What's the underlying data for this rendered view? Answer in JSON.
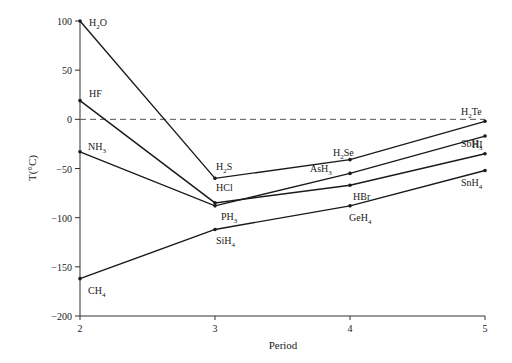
{
  "chart_data": {
    "type": "line",
    "title": "",
    "xlabel": "Period",
    "ylabel": "T(°C)",
    "x": [
      2,
      3,
      4,
      5
    ],
    "xlim": [
      2,
      5
    ],
    "ylim": [
      -200,
      100
    ],
    "xticks": [
      "2",
      "3",
      "4",
      "5"
    ],
    "yticks": [
      "100",
      "50",
      "0",
      "−50",
      "−100",
      "−150",
      "−200"
    ],
    "ytick_values": [
      100,
      50,
      0,
      -50,
      -100,
      -150,
      -200
    ],
    "grid": false,
    "reference_line": {
      "y": 0,
      "style": "dashed"
    },
    "series": [
      {
        "name": "Group 16",
        "labels": [
          "H2O",
          "H2S",
          "H2Se",
          "H2Te"
        ],
        "values": [
          100,
          -60,
          -41,
          -2
        ]
      },
      {
        "name": "Group 17",
        "labels": [
          "HF",
          "HCl",
          "HBr",
          "HI"
        ],
        "values": [
          19,
          -85,
          -67,
          -35
        ]
      },
      {
        "name": "Group 15",
        "labels": [
          "NH3",
          "PH3",
          "AsH3",
          "SbH3"
        ],
        "values": [
          -33,
          -88,
          -55,
          -17
        ]
      },
      {
        "name": "Group 14",
        "labels": [
          "CH4",
          "SiH4",
          "GeH4",
          "SnH4"
        ],
        "values": [
          -162,
          -112,
          -88,
          -52
        ]
      }
    ],
    "point_labels": [
      {
        "base": "H",
        "sub": "2",
        "rest": "O",
        "x": 2,
        "y": 100,
        "dx": 9,
        "dy": 5
      },
      {
        "base": "HF",
        "sub": "",
        "rest": "",
        "x": 2,
        "y": 19,
        "dx": 9,
        "dy": -4
      },
      {
        "base": "NH",
        "sub": "3",
        "rest": "",
        "x": 2,
        "y": -33,
        "dx": 8,
        "dy": -2
      },
      {
        "base": "CH",
        "sub": "4",
        "rest": "",
        "x": 2,
        "y": -162,
        "dx": 8,
        "dy": 15
      },
      {
        "base": "H",
        "sub": "2",
        "rest": "S",
        "x": 3,
        "y": -60,
        "dx": 1,
        "dy": -8
      },
      {
        "base": "HCl",
        "sub": "",
        "rest": "",
        "x": 3,
        "y": -85,
        "dx": 1,
        "dy": -12
      },
      {
        "base": "PH",
        "sub": "3",
        "rest": "",
        "x": 3,
        "y": -88,
        "dx": 6,
        "dy": 14
      },
      {
        "base": "SiH",
        "sub": "4",
        "rest": "",
        "x": 3,
        "y": -112,
        "dx": 1,
        "dy": 15
      },
      {
        "base": "H",
        "sub": "2",
        "rest": "Se",
        "x": 4,
        "y": -41,
        "dx": -17,
        "dy": -4
      },
      {
        "base": "AsH",
        "sub": "3",
        "rest": "",
        "x": 4,
        "y": -55,
        "dx": -40,
        "dy": -1
      },
      {
        "base": "HBr",
        "sub": "",
        "rest": "",
        "x": 4,
        "y": -67,
        "dx": 3,
        "dy": 15
      },
      {
        "base": "GeH",
        "sub": "4",
        "rest": "",
        "x": 4,
        "y": -88,
        "dx": -1,
        "dy": 15
      },
      {
        "base": "H",
        "sub": "2",
        "rest": "Te",
        "x": 5,
        "y": -2,
        "dx": -24,
        "dy": -6
      },
      {
        "base": "SbH",
        "sub": "3",
        "rest": "",
        "x": 5,
        "y": -17,
        "dx": -24,
        "dy": 11
      },
      {
        "base": "HI",
        "sub": "",
        "rest": "",
        "x": 5,
        "y": -35,
        "dx": -13,
        "dy": -6
      },
      {
        "base": "SnH",
        "sub": "4",
        "rest": "",
        "x": 5,
        "y": -52,
        "dx": -24,
        "dy": 16
      }
    ]
  },
  "colors": {
    "line": "#1a1a1a",
    "axis": "#333333",
    "dashed": "#555555"
  }
}
